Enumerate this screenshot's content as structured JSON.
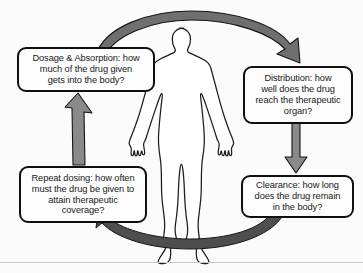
{
  "diagram": {
    "figure": {
      "name": "human-body-silhouette",
      "description": "Outline of a standing human body, arms slightly away from sides"
    },
    "boxes": [
      {
        "id": "dosage",
        "name": "Dosage & Absorption",
        "text": "Dosage & Absorption: how\nmuch of  the drug given\ngets into the body?",
        "position": "top-left"
      },
      {
        "id": "distribution",
        "name": "Distribution",
        "text": "Distribution: how\nwell does the drug\nreach the therapeutic\norgan?",
        "position": "top-right"
      },
      {
        "id": "clearance",
        "name": "Clearance",
        "text": "Clearance: how long\ndoes the drug remain\nin the body?",
        "position": "bottom-right"
      },
      {
        "id": "repeat",
        "name": "Repeat dosing",
        "text": "Repeat dosing: how often\nmust the drug be given to\nattain therapeutic\ncoverage?",
        "position": "bottom-left"
      }
    ],
    "arrows": [
      {
        "id": "arrow-top",
        "name": "arrow-dosage-to-distribution",
        "from": "dosage",
        "to": "distribution",
        "shape": "curved-arc-over-head",
        "direction": "left-to-right"
      },
      {
        "id": "arrow-right",
        "name": "arrow-distribution-to-clearance",
        "from": "distribution",
        "to": "clearance",
        "shape": "straight",
        "direction": "downward"
      },
      {
        "id": "arrow-bottom",
        "name": "arrow-clearance-to-repeat",
        "from": "clearance",
        "to": "repeat",
        "shape": "curved-arc-under-feet",
        "direction": "right-to-left"
      },
      {
        "id": "arrow-left",
        "name": "arrow-repeat-to-dosage",
        "from": "repeat",
        "to": "dosage",
        "shape": "straight-tapered",
        "direction": "upward"
      }
    ],
    "colors": {
      "background": "#fbfbfb",
      "box_fill": "#fdfdfd",
      "box_border": "#101010",
      "text": "#1a1a1a",
      "arrow_fill": "#808080",
      "arrow_fill_dark": "#4e4e4e",
      "arrow_stroke": "#151515",
      "body_outline": "#1d1d1d",
      "body_fill": "#ffffff"
    }
  }
}
